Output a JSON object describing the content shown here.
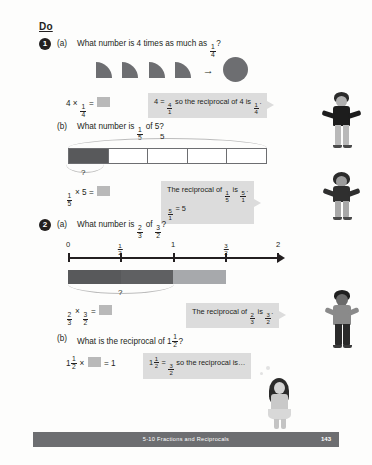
{
  "page": {
    "section_heading": "Do",
    "footer_title": "5-10 Fractions and Reciprocals",
    "footer_page": "143"
  },
  "colors": {
    "shape_gray": "#6d6e71",
    "bar_dark": "#58595b",
    "bar_mid": "#6d6e71",
    "bar_light": "#a7a9ac",
    "hint_bg": "#dcdcdc",
    "answer_box": "#b9b9b9",
    "footer_bg": "#6d6e71",
    "ink": "#231f20"
  },
  "questions": [
    {
      "number": "1",
      "parts": [
        {
          "label": "(a)",
          "prompt_prefix": "What number is 4 times as much as ",
          "prompt_fraction": {
            "num": "1",
            "den": "4"
          },
          "prompt_suffix": "?",
          "visual": {
            "type": "quarter-circles-to-circle",
            "quarter_count": 4,
            "arrow": "→"
          },
          "equation": {
            "left": "4 × ",
            "fraction": {
              "num": "1",
              "den": "4"
            },
            "equals": " = ",
            "answer": ""
          },
          "hint": {
            "line1_pre": "4 = ",
            "line1_frac": {
              "num": "4",
              "den": "1"
            },
            "line1_mid": " so the reciprocal of 4 is ",
            "line1_frac2": {
              "num": "1",
              "den": "4"
            },
            "line1_post": "."
          }
        },
        {
          "label": "(b)",
          "prompt_prefix": "What number is ",
          "prompt_fraction": {
            "num": "1",
            "den": "5"
          },
          "prompt_mid": " of 5",
          "prompt_suffix": "?",
          "visual": {
            "type": "bar-model",
            "cells": 5,
            "filled_cells": 1,
            "top_brace_label": "5",
            "bottom_brace_label": "?"
          },
          "equation": {
            "fraction": {
              "num": "1",
              "den": "5"
            },
            "left": " × 5",
            "equals": " = ",
            "answer": ""
          },
          "hint": {
            "line1_pre": "The reciprocal of ",
            "line1_frac": {
              "num": "1",
              "den": "5"
            },
            "line1_mid": " is ",
            "line1_frac2": {
              "num": "5",
              "den": "1"
            },
            "line1_post": ".",
            "line2_frac": {
              "num": "5",
              "den": "1"
            },
            "line2_post": " = 5"
          }
        }
      ]
    },
    {
      "number": "2",
      "parts": [
        {
          "label": "(a)",
          "prompt_prefix": "What number is ",
          "prompt_fraction": {
            "num": "2",
            "den": "3"
          },
          "prompt_mid": " of ",
          "prompt_fraction2": {
            "num": "3",
            "den": "2"
          },
          "prompt_suffix": "?",
          "visual": {
            "type": "number-line",
            "ticks": [
              {
                "value": 0,
                "label_type": "int",
                "label": "0"
              },
              {
                "value": 0.5,
                "label_type": "frac",
                "num": "1",
                "den": "2"
              },
              {
                "value": 1,
                "label_type": "int",
                "label": "1"
              },
              {
                "value": 1.5,
                "label_type": "frac",
                "num": "3",
                "den": "2"
              },
              {
                "value": 2,
                "label_type": "int",
                "label": "2"
              }
            ],
            "range": [
              0,
              2
            ],
            "segments": [
              {
                "from": 0,
                "to": 0.5,
                "shade": "dark"
              },
              {
                "from": 0.5,
                "to": 1,
                "shade": "mid"
              },
              {
                "from": 1,
                "to": 1.5,
                "shade": "light"
              }
            ],
            "bottom_brace_label": "?"
          },
          "equation": {
            "fraction": {
              "num": "2",
              "den": "3"
            },
            "left": " × ",
            "fraction2": {
              "num": "3",
              "den": "2"
            },
            "equals": " = ",
            "answer": ""
          },
          "hint": {
            "line1_pre": "The reciprocal of ",
            "line1_frac": {
              "num": "2",
              "den": "3"
            },
            "line1_mid": " is ",
            "line1_frac2": {
              "num": "3",
              "den": "2"
            },
            "line1_post": "."
          }
        },
        {
          "label": "(b)",
          "prompt_prefix": "What is the reciprocal of ",
          "prompt_mixed": {
            "whole": "1",
            "num": "1",
            "den": "2"
          },
          "prompt_suffix": "?",
          "equation": {
            "mixed": {
              "whole": "1",
              "num": "1",
              "den": "2"
            },
            "left": " × ",
            "answer": "",
            "equals": " = 1"
          },
          "hint": {
            "line1_mixed": {
              "whole": "1",
              "num": "1",
              "den": "2"
            },
            "line1_mid": " = ",
            "line1_frac": {
              "num": "3",
              "den": "2"
            },
            "line1_post": " so the reciprocal is…"
          }
        }
      ]
    }
  ],
  "characters": [
    {
      "name": "boy-black-top",
      "pose": "arms-out"
    },
    {
      "name": "girl-dark-top",
      "pose": "arms-out"
    },
    {
      "name": "boy-gray-top",
      "pose": "standing"
    },
    {
      "name": "girl-long-hair",
      "pose": "thinking"
    }
  ]
}
